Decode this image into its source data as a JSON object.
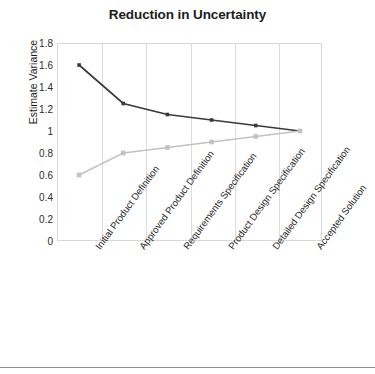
{
  "chart_data": {
    "type": "line",
    "title": "Reduction in Uncertainty",
    "xlabel": "",
    "ylabel": "Estimate Variance",
    "ylim": [
      0,
      1.8
    ],
    "ytick_step": 0.2,
    "yticks": [
      "1.8",
      "1.6",
      "1.4",
      "1.2",
      "1",
      "0.8",
      "0.6",
      "0.4",
      "0.2",
      "0"
    ],
    "grid": "vertical",
    "legend": "none",
    "categories": [
      "Initial Product Definition",
      "Approved Product Definition",
      "Requirements Specification",
      "Product Design Specification",
      "Detailed Design Specification",
      "Accepted Solution"
    ],
    "series": [
      {
        "name": "Upper estimate variance",
        "color": "#3a3a3a",
        "values": [
          1.6,
          1.25,
          1.15,
          1.1,
          1.05,
          1.0
        ]
      },
      {
        "name": "Lower estimate variance",
        "color": "#c2c2c2",
        "values": [
          0.6,
          0.8,
          0.85,
          0.9,
          0.95,
          1.0
        ]
      }
    ]
  },
  "colors": {
    "upper_series": "#3a3a3a",
    "lower_series": "#c2c2c2",
    "gridline": "#dcdcdc",
    "frame": "#d8d8d8",
    "text": "#1c1c1c",
    "rule": "#8e8e8e"
  }
}
